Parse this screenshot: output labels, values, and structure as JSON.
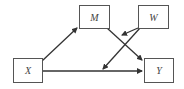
{
  "diagram": {
    "nodes": [
      {
        "id": "M",
        "label": "M"
      },
      {
        "id": "W",
        "label": "W"
      },
      {
        "id": "X",
        "label": "X"
      },
      {
        "id": "Y",
        "label": "Y"
      }
    ],
    "edges": [
      {
        "from": "X",
        "to": "M"
      },
      {
        "from": "M",
        "to": "Y"
      },
      {
        "from": "X",
        "to": "Y"
      },
      {
        "from": "W",
        "to": "M-Y path"
      },
      {
        "from": "W",
        "to": "X-Y path"
      }
    ],
    "colors": {
      "stroke": "#333333",
      "box": "#555555",
      "text": "#444444"
    }
  }
}
